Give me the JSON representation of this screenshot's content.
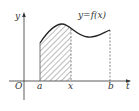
{
  "figure": {
    "curve_label": "y=f(x)",
    "axes": {
      "y_label": "y",
      "x_label": "t",
      "origin_label": "O"
    },
    "ticks": {
      "a": "a",
      "x": "x",
      "b": "b"
    },
    "colors": {
      "ink": "#333333",
      "background": "#ffffff"
    },
    "shaded_region": {
      "from": "a",
      "to": "x",
      "style": "diagonal-hatch"
    }
  }
}
